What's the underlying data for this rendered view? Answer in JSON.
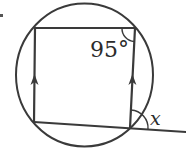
{
  "diagram": {
    "type": "cyclic-quadrilateral",
    "colors": {
      "stroke": "#3a3a3a",
      "text": "#2b2b2b",
      "background": "#ffffff"
    },
    "circle": {
      "cx": 84.5,
      "cy": 75,
      "rx": 68.5,
      "ry": 71.5
    },
    "vertices": {
      "top_left": [
        35,
        28
      ],
      "top_right": [
        135,
        28
      ],
      "bottom_right": [
        130,
        128
      ],
      "bottom_left": [
        34,
        122
      ]
    },
    "extended_line_end": [
      186,
      132
    ],
    "parallel_markers": [
      {
        "side": "left",
        "at": [
          34,
          75
        ],
        "direction": "up"
      },
      {
        "side": "right",
        "at": [
          132,
          75
        ],
        "direction": "up"
      }
    ],
    "labels": {
      "known_angle": "95°",
      "unknown_angle": "x"
    },
    "bullet_mark": "•"
  }
}
